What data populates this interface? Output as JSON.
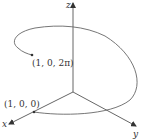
{
  "diagram": {
    "axes": {
      "x_label": "x",
      "y_label": "y",
      "z_label": "z"
    },
    "points": [
      {
        "id": "start",
        "label": "(1, 0, 0)"
      },
      {
        "id": "end",
        "label": "(1, 0, 2π)"
      }
    ],
    "colors": {
      "axis": "#555555",
      "curve": "#666666",
      "text": "#333333"
    }
  }
}
